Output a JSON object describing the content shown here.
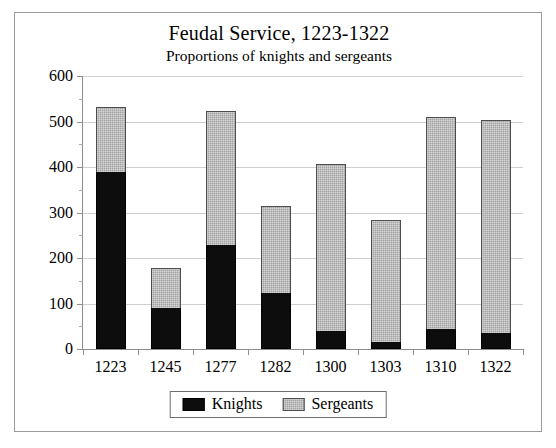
{
  "chart_data": {
    "type": "bar",
    "stacked": true,
    "title": "Feudal Service, 1223-1322",
    "subtitle": "Proportions of knights and sergeants",
    "xlabel": "",
    "ylabel": "",
    "ylim": [
      0,
      600
    ],
    "ytick_step": 100,
    "yminor_step": 50,
    "grid": true,
    "legend_position": "bottom-center",
    "categories": [
      "1223",
      "1245",
      "1277",
      "1282",
      "1300",
      "1303",
      "1310",
      "1322"
    ],
    "ytick_labels": [
      "0",
      "100",
      "200",
      "300",
      "400",
      "500",
      "600"
    ],
    "series": [
      {
        "name": "Knights",
        "color": "#0d0d0d",
        "values": [
          389,
          91,
          228,
          124,
          40,
          15,
          44,
          35
        ]
      },
      {
        "name": "Sergeants",
        "color": "#a3a3a3",
        "values": [
          144,
          87,
          295,
          190,
          367,
          268,
          466,
          468
        ]
      }
    ],
    "totals": [
      533,
      178,
      523,
      314,
      407,
      283,
      510,
      503
    ]
  }
}
